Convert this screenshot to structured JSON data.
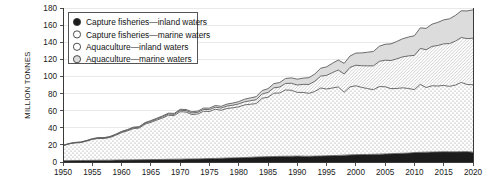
{
  "chart_data": {
    "type": "area",
    "stacked": true,
    "title": "",
    "xlabel": "",
    "ylabel": "MILLION TONNES",
    "xlim": [
      1950,
      2020
    ],
    "ylim": [
      0,
      180
    ],
    "ytick_step": 20,
    "xtick_step": 5,
    "grid": true,
    "legend_position": "top-left",
    "yticks": [
      0,
      20,
      40,
      60,
      80,
      100,
      120,
      140,
      160,
      180
    ],
    "xticks": [
      1950,
      1955,
      1960,
      1965,
      1970,
      1975,
      1980,
      1985,
      1990,
      1995,
      2000,
      2005,
      2010,
      2015,
      2020
    ],
    "x": [
      1950,
      1951,
      1952,
      1953,
      1954,
      1955,
      1956,
      1957,
      1958,
      1959,
      1960,
      1961,
      1962,
      1963,
      1964,
      1965,
      1966,
      1967,
      1968,
      1969,
      1970,
      1971,
      1972,
      1973,
      1974,
      1975,
      1976,
      1977,
      1978,
      1979,
      1980,
      1981,
      1982,
      1983,
      1984,
      1985,
      1986,
      1987,
      1988,
      1989,
      1990,
      1991,
      1992,
      1993,
      1994,
      1995,
      1996,
      1997,
      1998,
      1999,
      2000,
      2001,
      2002,
      2003,
      2004,
      2005,
      2006,
      2007,
      2008,
      2009,
      2010,
      2011,
      2012,
      2013,
      2014,
      2015,
      2016,
      2017,
      2018,
      2019,
      2020
    ],
    "series": [
      {
        "name": "Capture fisheries—inland waters",
        "key": "capture_inland",
        "fill": "#1c1c1c",
        "pattern": "solid",
        "marker": "filled-circle",
        "values": [
          1.5,
          1.6,
          1.7,
          1.7,
          1.8,
          1.9,
          2.0,
          2.0,
          2.1,
          2.2,
          2.3,
          2.4,
          2.5,
          2.6,
          2.7,
          2.8,
          2.9,
          3.0,
          3.1,
          3.2,
          3.3,
          3.4,
          3.5,
          3.6,
          3.8,
          4.0,
          4.2,
          4.4,
          4.6,
          4.8,
          5.0,
          5.2,
          5.5,
          5.8,
          6.0,
          6.2,
          6.4,
          6.6,
          6.7,
          6.8,
          6.9,
          6.8,
          6.7,
          6.9,
          7.0,
          7.3,
          7.5,
          7.7,
          8.0,
          8.3,
          8.6,
          8.7,
          8.8,
          9.0,
          9.2,
          9.4,
          9.7,
          10.0,
          10.2,
          10.4,
          11.1,
          11.3,
          11.5,
          11.6,
          11.8,
          12.0,
          11.9,
          11.9,
          12.0,
          12.1,
          11.5
        ]
      },
      {
        "name": "Capture fisheries—marine waters",
        "key": "capture_marine",
        "fill": "#ffffff",
        "pattern": "dots",
        "marker": "open-circle",
        "values": [
          17.5,
          19.5,
          20.5,
          21.0,
          22.5,
          24.5,
          25.5,
          25.5,
          26.5,
          29.0,
          32.0,
          34.0,
          36.5,
          37.0,
          41.5,
          43.5,
          46.0,
          48.5,
          51.5,
          51.0,
          55.5,
          55.0,
          52.0,
          52.5,
          55.5,
          55.0,
          57.5,
          56.0,
          58.0,
          58.5,
          59.5,
          61.5,
          62.0,
          62.5,
          68.5,
          69.5,
          74.0,
          74.0,
          77.5,
          77.0,
          74.5,
          74.5,
          73.5,
          75.5,
          79.5,
          78.0,
          79.0,
          80.0,
          73.5,
          79.5,
          80.5,
          78.5,
          77.0,
          75.5,
          79.0,
          78.5,
          76.0,
          76.0,
          76.5,
          75.5,
          73.5,
          79.5,
          75.5,
          77.5,
          77.0,
          77.5,
          76.5,
          78.0,
          81.0,
          78.5,
          78.8
        ]
      },
      {
        "name": "Aquaculture—inland waters",
        "key": "aquaculture_inland",
        "fill": "#ffffff",
        "pattern": "diagonal",
        "marker": "open-circle",
        "values": [
          0.3,
          0.3,
          0.4,
          0.4,
          0.5,
          0.5,
          0.6,
          0.6,
          0.7,
          0.8,
          0.9,
          0.9,
          1.0,
          1.0,
          1.1,
          1.2,
          1.3,
          1.4,
          1.4,
          1.5,
          1.6,
          1.7,
          1.8,
          1.9,
          2.1,
          2.2,
          2.4,
          2.6,
          2.8,
          3.1,
          3.4,
          3.7,
          4.1,
          4.5,
          5.0,
          5.6,
          6.3,
          7.0,
          7.6,
          8.2,
          8.6,
          9.4,
          10.5,
          12.0,
          13.9,
          15.9,
          18.0,
          19.8,
          21.3,
          22.8,
          24.0,
          25.3,
          26.6,
          27.9,
          29.4,
          31.1,
          32.9,
          34.6,
          36.2,
          38.1,
          40.0,
          42.0,
          44.2,
          46.0,
          47.4,
          48.6,
          50.0,
          51.4,
          52.5,
          53.6,
          54.4
        ]
      },
      {
        "name": "Aquaculture—marine waters",
        "key": "aquaculture_marine",
        "fill": "#dcdcdc",
        "pattern": "solid-gray",
        "marker": "gray-circle",
        "values": [
          0.2,
          0.2,
          0.3,
          0.3,
          0.3,
          0.4,
          0.4,
          0.4,
          0.5,
          0.5,
          0.6,
          0.6,
          0.7,
          0.7,
          0.8,
          0.9,
          0.9,
          1.0,
          1.1,
          1.1,
          1.2,
          1.3,
          1.4,
          1.5,
          1.6,
          1.8,
          1.9,
          2.1,
          2.3,
          2.5,
          2.7,
          3.0,
          3.3,
          3.6,
          4.0,
          4.4,
          4.9,
          5.3,
          5.8,
          6.3,
          6.8,
          7.3,
          7.9,
          8.5,
          9.2,
          10.0,
          10.9,
          11.7,
          12.5,
          13.3,
          14.2,
          15.0,
          15.9,
          16.8,
          17.7,
          18.6,
          19.5,
          20.3,
          21.2,
          22.1,
          23.0,
          24.0,
          25.0,
          26.0,
          27.0,
          28.0,
          29.0,
          30.1,
          31.2,
          32.4,
          33.1
        ]
      }
    ]
  },
  "axis": {
    "ylabel": "MILLION TONNES"
  },
  "legend": {
    "items": [
      {
        "label": "Capture fisheries—inland waters"
      },
      {
        "label": "Capture fisheries—marine waters"
      },
      {
        "label": "Aquaculture—inland waters"
      },
      {
        "label": "Aquaculture—marine waters"
      }
    ]
  },
  "colors": {
    "capture_inland": "#1c1c1c",
    "capture_marine": "#ffffff",
    "aquaculture_inland": "#ffffff",
    "aquaculture_marine": "#dcdcdc",
    "outline": "#5c5c5c",
    "axis": "#3a3a3a",
    "grid": "#e3e3e3",
    "text": "#1a1a1a"
  }
}
